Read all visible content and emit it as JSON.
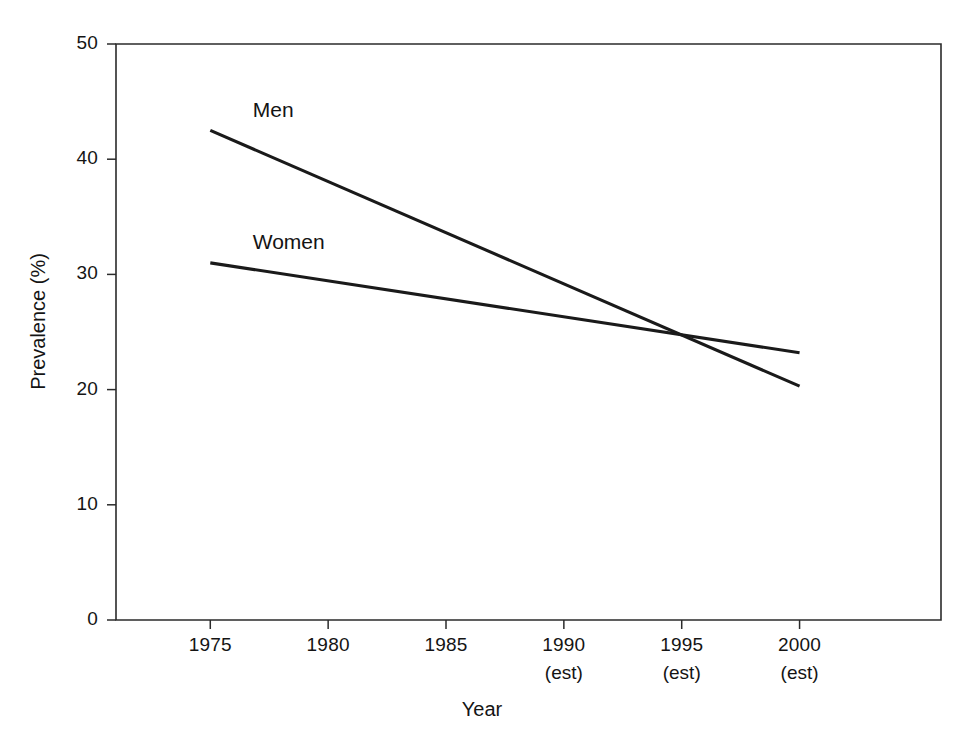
{
  "chart_data": {
    "type": "line",
    "title": "",
    "xlabel": "Year",
    "ylabel": "Prevalence (%)",
    "x": [
      1975,
      2000
    ],
    "xlim": [
      1971,
      2006
    ],
    "ylim": [
      0,
      50
    ],
    "xticks": [
      1975,
      1980,
      1985,
      1990,
      1995,
      2000
    ],
    "xtick_labels": [
      "1975",
      "1980",
      "1985",
      "1990",
      "1995",
      "2000"
    ],
    "xtick_sublabels": [
      "",
      "",
      "",
      "(est)",
      "(est)",
      "(est)"
    ],
    "yticks": [
      0,
      10,
      20,
      30,
      40,
      50
    ],
    "ytick_labels": [
      "0",
      "10",
      "20",
      "30",
      "40",
      "50"
    ],
    "grid": false,
    "legend_position": "inline-labels",
    "series": [
      {
        "name": "Men",
        "color": "#1a1a1a",
        "x": [
          1975,
          2000
        ],
        "values": [
          42.5,
          20.3
        ]
      },
      {
        "name": "Women",
        "color": "#1a1a1a",
        "x": [
          1975,
          2000
        ],
        "values": [
          31.0,
          23.2
        ]
      }
    ],
    "annotations": [
      {
        "text": "Men",
        "x": 1976.8,
        "y": 44.2
      },
      {
        "text": "Women",
        "x": 1976.8,
        "y": 32.7
      }
    ]
  },
  "axis": {
    "y_title": "Prevalence (%)",
    "x_title": "Year"
  }
}
